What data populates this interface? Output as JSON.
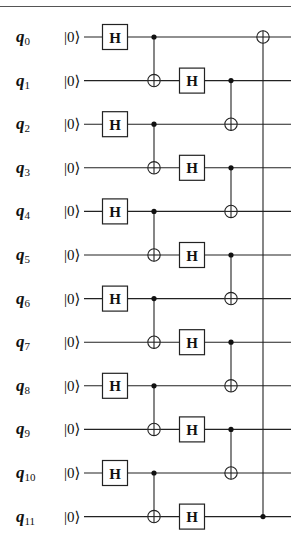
{
  "diagram": {
    "type": "quantum-circuit",
    "num_qubits": 12,
    "qubits": [
      {
        "label": "q",
        "index": "0",
        "init": "|0⟩"
      },
      {
        "label": "q",
        "index": "1",
        "init": "|0⟩"
      },
      {
        "label": "q",
        "index": "2",
        "init": "|0⟩"
      },
      {
        "label": "q",
        "index": "3",
        "init": "|0⟩"
      },
      {
        "label": "q",
        "index": "4",
        "init": "|0⟩"
      },
      {
        "label": "q",
        "index": "5",
        "init": "|0⟩"
      },
      {
        "label": "q",
        "index": "6",
        "init": "|0⟩"
      },
      {
        "label": "q",
        "index": "7",
        "init": "|0⟩"
      },
      {
        "label": "q",
        "index": "8",
        "init": "|0⟩"
      },
      {
        "label": "q",
        "index": "9",
        "init": "|0⟩"
      },
      {
        "label": "q",
        "index": "10",
        "init": "|0⟩"
      },
      {
        "label": "q",
        "index": "11",
        "init": "|0⟩"
      }
    ],
    "gate_label": "H",
    "columns": [
      {
        "x": 115,
        "gates": [
          {
            "type": "H",
            "qubit": 0
          },
          {
            "type": "H",
            "qubit": 2
          },
          {
            "type": "H",
            "qubit": 4
          },
          {
            "type": "H",
            "qubit": 6
          },
          {
            "type": "H",
            "qubit": 8
          },
          {
            "type": "H",
            "qubit": 10
          }
        ]
      },
      {
        "x": 154,
        "gates": [
          {
            "type": "CNOT",
            "control": 0,
            "target": 1
          },
          {
            "type": "CNOT",
            "control": 2,
            "target": 3
          },
          {
            "type": "CNOT",
            "control": 4,
            "target": 5
          },
          {
            "type": "CNOT",
            "control": 6,
            "target": 7
          },
          {
            "type": "CNOT",
            "control": 8,
            "target": 9
          },
          {
            "type": "CNOT",
            "control": 10,
            "target": 11
          }
        ]
      },
      {
        "x": 192,
        "gates": [
          {
            "type": "H",
            "qubit": 1
          },
          {
            "type": "H",
            "qubit": 3
          },
          {
            "type": "H",
            "qubit": 5
          },
          {
            "type": "H",
            "qubit": 7
          },
          {
            "type": "H",
            "qubit": 9
          },
          {
            "type": "H",
            "qubit": 11
          }
        ]
      },
      {
        "x": 231,
        "gates": [
          {
            "type": "CNOT",
            "control": 1,
            "target": 2
          },
          {
            "type": "CNOT",
            "control": 3,
            "target": 4
          },
          {
            "type": "CNOT",
            "control": 5,
            "target": 6
          },
          {
            "type": "CNOT",
            "control": 7,
            "target": 8
          },
          {
            "type": "CNOT",
            "control": 9,
            "target": 10
          }
        ]
      },
      {
        "x": 263,
        "gates": [
          {
            "type": "CNOT",
            "control": 11,
            "target": 0
          }
        ]
      }
    ]
  }
}
